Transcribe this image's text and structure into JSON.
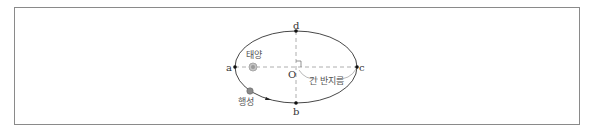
{
  "diagram": {
    "type": "elliptical-orbit",
    "points": {
      "a": "a",
      "b": "b",
      "c": "c",
      "d": "d",
      "center": "O"
    },
    "labels": {
      "sun": "태양",
      "planet": "행성",
      "semi_major_axis": "긴 반지름"
    },
    "colors": {
      "orbit": "#333333",
      "axis_dash": "#999999",
      "sun": "#b0b0b0",
      "planet": "#808080",
      "frame": "#8a8a8a"
    }
  }
}
